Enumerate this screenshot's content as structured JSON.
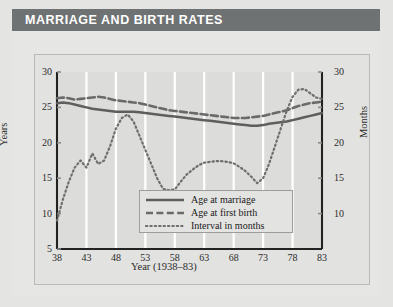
{
  "header": {
    "title": "MARRIAGE AND BIRTH RATES",
    "bar_color": "#6f7273",
    "title_color": "#ffffff"
  },
  "panel": {
    "background": "#e6e6e4",
    "plot_background": "#dcdcda",
    "gridline_color": "#ffffff",
    "axis_color": "#222222"
  },
  "chart_data": {
    "type": "line",
    "title": "MARRIAGE AND BIRTH RATES",
    "xlabel": "Year (1938–83)",
    "ylabel": "Years",
    "ylabel_right": "Months",
    "xlim": [
      38,
      83
    ],
    "ylim": [
      5,
      30
    ],
    "ylim_right": [
      5,
      30
    ],
    "grid": "vertical",
    "legend_position": "bottom-center",
    "xticks": [
      "38",
      "43",
      "48",
      "53",
      "58",
      "63",
      "68",
      "73",
      "78",
      "83"
    ],
    "xtick_values": [
      38,
      43,
      48,
      53,
      58,
      63,
      68,
      73,
      78,
      83
    ],
    "yticks": [
      "5",
      "10",
      "15",
      "20",
      "25",
      "30"
    ],
    "ytick_values": [
      5,
      10,
      15,
      20,
      25,
      30
    ],
    "yticks_right": [
      "10",
      "15",
      "20",
      "25",
      "30"
    ],
    "ytick_values_right": [
      10,
      15,
      20,
      25,
      30
    ],
    "x": [
      38,
      39,
      40,
      41,
      42,
      43,
      44,
      45,
      46,
      47,
      48,
      49,
      50,
      51,
      52,
      53,
      54,
      55,
      56,
      57,
      58,
      59,
      60,
      61,
      62,
      63,
      64,
      65,
      66,
      67,
      68,
      69,
      70,
      71,
      72,
      73,
      74,
      75,
      76,
      77,
      78,
      79,
      80,
      81,
      82,
      83
    ],
    "series": [
      {
        "name": "Age at marriage",
        "style": "solid",
        "color": "#5e5e5e",
        "axis": "left",
        "unit": "years",
        "values": [
          25.6,
          25.7,
          25.6,
          25.4,
          25.2,
          25.0,
          24.8,
          24.7,
          24.6,
          24.5,
          24.4,
          24.4,
          24.4,
          24.4,
          24.3,
          24.2,
          24.1,
          24.0,
          23.9,
          23.8,
          23.7,
          23.6,
          23.5,
          23.4,
          23.3,
          23.2,
          23.1,
          23.0,
          22.9,
          22.8,
          22.7,
          22.6,
          22.5,
          22.4,
          22.4,
          22.5,
          22.7,
          22.8,
          22.9,
          23.0,
          23.2,
          23.4,
          23.6,
          23.8,
          24.0,
          24.2
        ]
      },
      {
        "name": "Age at first birth",
        "style": "dashed",
        "color": "#6a6a6a",
        "axis": "left",
        "unit": "years",
        "values": [
          26.3,
          26.4,
          26.3,
          26.1,
          26.2,
          26.3,
          26.4,
          26.5,
          26.4,
          26.2,
          26.0,
          25.9,
          25.8,
          25.7,
          25.6,
          25.4,
          25.2,
          25.0,
          24.8,
          24.6,
          24.5,
          24.4,
          24.3,
          24.2,
          24.1,
          24.0,
          23.9,
          23.8,
          23.7,
          23.6,
          23.5,
          23.5,
          23.5,
          23.6,
          23.7,
          23.8,
          24.0,
          24.2,
          24.4,
          24.6,
          24.9,
          25.2,
          25.4,
          25.6,
          25.7,
          25.8
        ]
      },
      {
        "name": "Interval in months",
        "style": "dotted",
        "color": "#6e6e6e",
        "axis": "right",
        "unit": "months",
        "values": [
          9.0,
          12.0,
          14.5,
          16.5,
          17.5,
          16.5,
          18.5,
          17.0,
          17.5,
          19.5,
          22.0,
          23.5,
          24.0,
          23.0,
          21.0,
          19.0,
          17.0,
          15.0,
          13.5,
          13.3,
          13.4,
          14.5,
          15.5,
          16.2,
          16.8,
          17.2,
          17.3,
          17.4,
          17.4,
          17.3,
          17.1,
          16.6,
          16.0,
          15.2,
          14.3,
          15.0,
          17.0,
          19.5,
          22.0,
          24.5,
          26.5,
          27.5,
          27.6,
          27.0,
          26.4,
          26.2
        ]
      }
    ]
  },
  "legend": {
    "items": [
      {
        "label": "Age at marriage",
        "style": "solid"
      },
      {
        "label": "Age at first birth",
        "style": "dashed"
      },
      {
        "label": "Interval in months",
        "style": "dotted"
      }
    ]
  }
}
